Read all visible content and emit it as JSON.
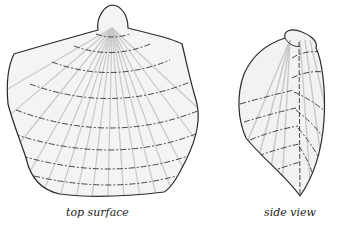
{
  "figure": {
    "panels": [
      {
        "id": "top",
        "label": "top surface"
      },
      {
        "id": "side",
        "label": "side view"
      }
    ],
    "colors": {
      "outline": "#2a2a2a",
      "shade": "#c8c8c8",
      "background": "#ffffff"
    }
  }
}
